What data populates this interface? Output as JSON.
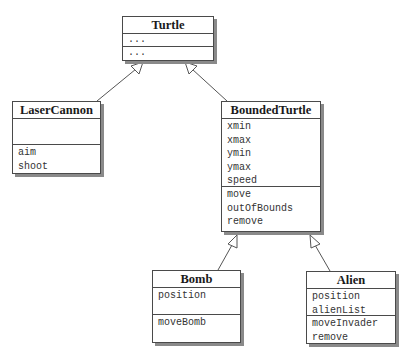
{
  "diagram": {
    "type": "uml-class-diagram",
    "classes": {
      "turtle": {
        "name": "Turtle",
        "attributes": [
          "..."
        ],
        "operations": [
          "..."
        ]
      },
      "laser_cannon": {
        "name": "LaserCannon",
        "attributes": [],
        "operations": [
          "aim",
          "shoot"
        ]
      },
      "bounded_turtle": {
        "name": "BoundedTurtle",
        "attributes": [
          "xmin",
          "xmax",
          "ymin",
          "ymax",
          "speed"
        ],
        "operations": [
          "move",
          "outOfBounds",
          "remove"
        ]
      },
      "bomb": {
        "name": "Bomb",
        "attributes": [
          "position"
        ],
        "operations": [
          "moveBomb"
        ]
      },
      "alien": {
        "name": "Alien",
        "attributes": [
          "position",
          "alienList"
        ],
        "operations": [
          "moveInvader",
          "remove"
        ]
      }
    },
    "relationships": [
      {
        "type": "inheritance",
        "from": "LaserCannon",
        "to": "Turtle"
      },
      {
        "type": "inheritance",
        "from": "BoundedTurtle",
        "to": "Turtle"
      },
      {
        "type": "inheritance",
        "from": "Bomb",
        "to": "BoundedTurtle"
      },
      {
        "type": "inheritance",
        "from": "Alien",
        "to": "BoundedTurtle"
      }
    ],
    "colors": {
      "border": "#4a4a4a",
      "shadow": "#8a8a8a",
      "text": "#1a1a1a",
      "background": "#ffffff"
    }
  }
}
